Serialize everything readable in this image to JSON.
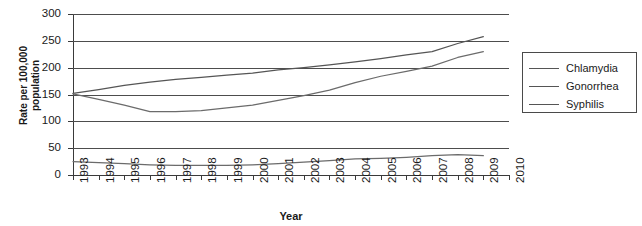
{
  "chart_data": {
    "type": "line",
    "title": "",
    "xlabel": "Year",
    "ylabel": "Rate per 100,000\npopulation",
    "ylim": [
      0,
      300
    ],
    "yticks": [
      0,
      50,
      100,
      150,
      200,
      250,
      300
    ],
    "grid": true,
    "legend_position": "right",
    "x": [
      1993,
      1994,
      1995,
      1996,
      1997,
      1998,
      1999,
      2000,
      2001,
      2002,
      2003,
      2004,
      2005,
      2006,
      2007,
      2008,
      2009,
      2010
    ],
    "categories": [
      "1993",
      "1994",
      "1995",
      "1996",
      "1997",
      "1998",
      "1999",
      "2000",
      "2001",
      "2002",
      "2003",
      "2004",
      "2005",
      "2006",
      "2007",
      "2008",
      "2009",
      "2010"
    ],
    "series": [
      {
        "name": "Chlamydia",
        "color": "#555555",
        "values": [
          152,
          159,
          167,
          173,
          178,
          182,
          186,
          190,
          196,
          200,
          205,
          211,
          217,
          224,
          230,
          245,
          258,
          null
        ]
      },
      {
        "name": "Gonorrhea",
        "color": "#6b6b6b",
        "values": [
          151,
          141,
          130,
          118,
          118,
          120,
          125,
          130,
          139,
          148,
          158,
          172,
          184,
          193,
          203,
          219,
          230,
          null
        ]
      },
      {
        "name": "Syphilis",
        "color": "#6b6b6b",
        "values": [
          25,
          23,
          21,
          19,
          18,
          18,
          18,
          19,
          21,
          24,
          27,
          30,
          31,
          33,
          36,
          38,
          36,
          null
        ]
      }
    ]
  },
  "legend": {
    "items": [
      {
        "label": "Chlamydia"
      },
      {
        "label": "Gonorrhea"
      },
      {
        "label": "Syphilis"
      }
    ]
  },
  "axes": {
    "y_title": "Rate per 100,000\npopulation",
    "x_title": "Year",
    "y_tick_labels": [
      "300",
      "250",
      "200",
      "150",
      "100",
      "50",
      "0"
    ],
    "x_tick_labels": [
      "1993",
      "1994",
      "1995",
      "1996",
      "1997",
      "1998",
      "1999",
      "2000",
      "2001",
      "2002",
      "2003",
      "2004",
      "2005",
      "2006",
      "2007",
      "2008",
      "2009",
      "2010"
    ]
  }
}
